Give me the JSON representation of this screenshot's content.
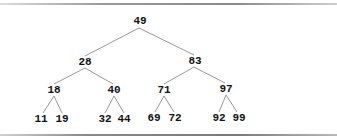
{
  "diagram": {
    "type": "binary-search-tree",
    "edge_color": "#8c8c8c",
    "text_color": "#111111",
    "nodes": [
      {
        "id": "n49",
        "label": "49",
        "x": 140,
        "y": 24
      },
      {
        "id": "n28",
        "label": "28",
        "x": 85,
        "y": 65
      },
      {
        "id": "n83",
        "label": "83",
        "x": 195,
        "y": 64
      },
      {
        "id": "n18",
        "label": "18",
        "x": 54,
        "y": 93
      },
      {
        "id": "n40",
        "label": "40",
        "x": 114,
        "y": 93
      },
      {
        "id": "n71",
        "label": "71",
        "x": 164,
        "y": 93
      },
      {
        "id": "n97",
        "label": "97",
        "x": 226,
        "y": 92
      },
      {
        "id": "n11",
        "label": "11",
        "x": 41,
        "y": 122
      },
      {
        "id": "n19",
        "label": "19",
        "x": 62,
        "y": 122
      },
      {
        "id": "n32",
        "label": "32",
        "x": 105,
        "y": 122
      },
      {
        "id": "n44",
        "label": "44",
        "x": 124,
        "y": 122
      },
      {
        "id": "n69",
        "label": "69",
        "x": 154,
        "y": 121
      },
      {
        "id": "n72",
        "label": "72",
        "x": 175,
        "y": 121
      },
      {
        "id": "n92",
        "label": "92",
        "x": 219,
        "y": 121
      },
      {
        "id": "n99",
        "label": "99",
        "x": 239,
        "y": 121
      }
    ],
    "edges": [
      {
        "from": "49",
        "to": "28"
      },
      {
        "from": "49",
        "to": "83"
      },
      {
        "from": "28",
        "to": "18"
      },
      {
        "from": "28",
        "to": "40"
      },
      {
        "from": "83",
        "to": "71"
      },
      {
        "from": "83",
        "to": "97"
      },
      {
        "from": "18",
        "to": "11"
      },
      {
        "from": "18",
        "to": "19"
      },
      {
        "from": "40",
        "to": "32"
      },
      {
        "from": "40",
        "to": "44"
      },
      {
        "from": "71",
        "to": "69"
      },
      {
        "from": "71",
        "to": "72"
      },
      {
        "from": "97",
        "to": "92"
      },
      {
        "from": "97",
        "to": "99"
      }
    ]
  }
}
